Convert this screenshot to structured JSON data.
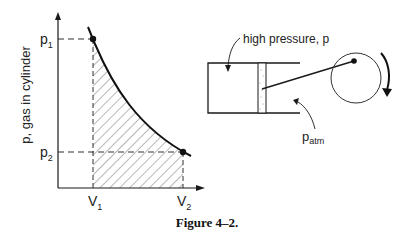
{
  "pv_plot": {
    "y_axis_label": "p, gas in cylinder",
    "p1_label": "p",
    "p1_sub": "1",
    "p2_label": "p",
    "p2_sub": "2",
    "v1_label": "V",
    "v1_sub": "1",
    "v2_label": "V",
    "v2_sub": "2"
  },
  "engine": {
    "high_pressure_label": "high pressure, p",
    "patm_label": "p",
    "patm_sub": "atm"
  },
  "caption": "Figure 4–2.",
  "colors": {
    "ink": "#1a1a1a",
    "background": "#ffffff"
  }
}
